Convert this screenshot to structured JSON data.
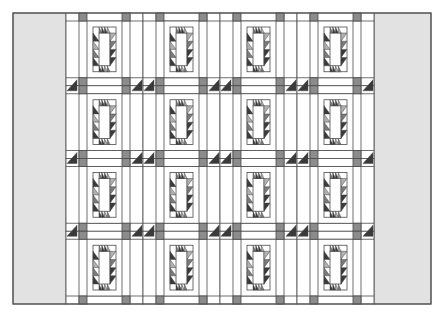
{
  "figure": {
    "title": ""
  },
  "canvas": {
    "width": 435,
    "height": 316,
    "background": "#ffffff"
  },
  "frame": {
    "x": 13,
    "y": 13,
    "width": 418,
    "height": 291,
    "stroke": "#555555"
  },
  "side_borders": [
    {
      "name": "left-border",
      "x": 13,
      "y": 13,
      "width": 53,
      "height": 291,
      "fill": "#e2e2e2"
    },
    {
      "name": "right-border",
      "x": 374,
      "y": 13,
      "width": 57,
      "height": 291,
      "fill": "#e2e2e2"
    }
  ],
  "grid": {
    "x0": 66,
    "y0": 13,
    "cols": 4,
    "rows": 4,
    "col_width": 77,
    "row_height": 72.75
  },
  "colors": {
    "white": "#ffffff",
    "line": "#4a4a4a",
    "cornerstone": "#8c8c8c",
    "dark_triangle": "#3a3a3a",
    "mid_triangle": "#7a7a7a",
    "light_triangle": "#b0b0b0",
    "border_gray": "#e2e2e2"
  },
  "block": {
    "cornerstone_size": 8,
    "outer_strip": 13,
    "inner_ring_inset": 21,
    "sawtooth_size": 6,
    "teeth_per_side": 4
  }
}
